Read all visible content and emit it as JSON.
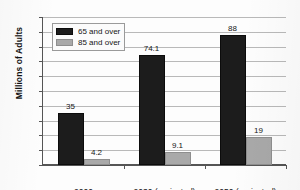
{
  "chart_data": {
    "type": "bar",
    "title": "",
    "xlabel": "",
    "ylabel": "Millions of Adults",
    "categories": [
      "2000",
      "2030 (projected)",
      "2050 (projected)"
    ],
    "series": [
      {
        "name": "65 and over",
        "color": "#1c1c1c",
        "values": [
          35,
          74.1,
          88
        ],
        "labels": [
          "35",
          "74.1",
          "88"
        ]
      },
      {
        "name": "85 and over",
        "color": "#a9a9a9",
        "values": [
          4.2,
          9.1,
          19
        ],
        "labels": [
          "4.2",
          "9.1",
          "19"
        ]
      }
    ],
    "ylim": [
      0,
      100
    ],
    "ytick_step": 10,
    "yticks": [
      "100",
      "90",
      "80",
      "70",
      "60",
      "50",
      "40",
      "30",
      "20",
      "10",
      "0"
    ],
    "grid": true,
    "legend_position": "upper-left-inside"
  },
  "legend": {
    "entries": [
      {
        "label": "65 and over",
        "swatch": "black-swatch"
      },
      {
        "label": "85 and over",
        "swatch": "gray-swatch"
      }
    ]
  }
}
